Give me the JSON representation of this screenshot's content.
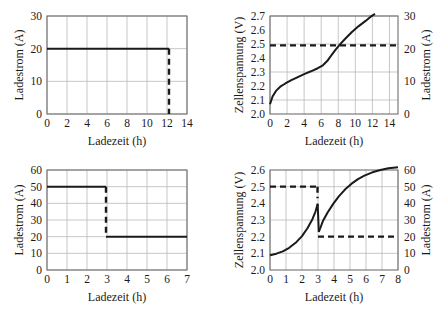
{
  "figure": {
    "background": "#ffffff",
    "line_color": "#1a1a1a",
    "grid_color": "#b9b9b9",
    "frame_color": "#6f6f6f"
  },
  "labels": {
    "ladezeit": "Ladezeit (h)",
    "ladestrom": "Ladestrom (A)",
    "zellenspannung": "Zellenspannung (V)"
  },
  "chart_data": [
    {
      "id": "top-left",
      "type": "line",
      "title": "",
      "xlabel": "Ladezeit (h)",
      "ylabel": "Ladestrom (A)",
      "xlim": [
        0,
        14
      ],
      "ylim": [
        0,
        30
      ],
      "xticks": [
        0,
        2,
        4,
        6,
        8,
        10,
        12,
        14
      ],
      "yticks": [
        0,
        10,
        20,
        30
      ],
      "xtick_labels": [
        "0",
        "2",
        "4",
        "6",
        "8",
        "10",
        "12",
        "14"
      ],
      "ytick_labels": [
        "0",
        "10",
        "20",
        "30"
      ],
      "grid": true,
      "legend": "none",
      "series": [
        {
          "name": "Ladestrom konstant",
          "style": "solid",
          "x": [
            0,
            12.2
          ],
          "values": [
            20,
            20
          ]
        },
        {
          "name": "Stromabschaltung",
          "style": "dashed",
          "x": [
            12.2,
            12.2
          ],
          "values": [
            20,
            0
          ]
        }
      ]
    },
    {
      "id": "top-right",
      "type": "line",
      "title": "",
      "xlabel": "Ladezeit (h)",
      "ylabel": "Zellenspannung (V)",
      "ylabel_right": "Ladestrom (A)",
      "xlim": [
        0,
        15
      ],
      "ylim": [
        2.0,
        2.7
      ],
      "ylim_right": [
        0,
        30
      ],
      "xticks": [
        0,
        2,
        4,
        6,
        8,
        10,
        12,
        14
      ],
      "yticks": [
        2.0,
        2.1,
        2.2,
        2.3,
        2.4,
        2.5,
        2.6,
        2.7
      ],
      "yticks_right": [
        0,
        10,
        20,
        30
      ],
      "xtick_labels": [
        "0",
        "2",
        "4",
        "6",
        "8",
        "10",
        "12",
        "14"
      ],
      "ytick_labels": [
        "2.0",
        "2.1",
        "2.2",
        "2.3",
        "2.4",
        "2.5",
        "2.6",
        "2.7"
      ],
      "ytick_labels_right": [
        "0",
        "10",
        "20",
        "30"
      ],
      "grid": true,
      "legend": "none",
      "series": [
        {
          "name": "Zellenspannung",
          "style": "solid",
          "axis": "left",
          "x": [
            0,
            0.3,
            0.7,
            1.2,
            1.8,
            2.5,
            3.2,
            4.0,
            4.8,
            5.6,
            6.2,
            6.7,
            7.1,
            7.6,
            8.2,
            8.9,
            9.6,
            10.4,
            11.2,
            11.8,
            12.3
          ],
          "values": [
            2.07,
            2.125,
            2.165,
            2.195,
            2.218,
            2.242,
            2.262,
            2.285,
            2.305,
            2.327,
            2.348,
            2.378,
            2.412,
            2.452,
            2.497,
            2.543,
            2.586,
            2.628,
            2.665,
            2.695,
            2.715
          ]
        },
        {
          "name": "Ladestrom konstant 21 A",
          "style": "dashed",
          "axis": "right",
          "x": [
            0,
            15
          ],
          "values": [
            21,
            21
          ]
        }
      ]
    },
    {
      "id": "bottom-left",
      "type": "line",
      "title": "",
      "xlabel": "Ladezeit (h)",
      "ylabel": "Ladestrom (A)",
      "xlim": [
        0,
        7
      ],
      "ylim": [
        0,
        60
      ],
      "xticks": [
        0,
        1,
        2,
        3,
        4,
        5,
        6,
        7
      ],
      "yticks": [
        0,
        10,
        20,
        30,
        40,
        50,
        60
      ],
      "xtick_labels": [
        "0",
        "1",
        "2",
        "3",
        "4",
        "5",
        "6",
        "7"
      ],
      "ytick_labels": [
        "0",
        "10",
        "20",
        "30",
        "40",
        "50",
        "60"
      ],
      "grid": true,
      "legend": "none",
      "series": [
        {
          "name": "Ladestrom Stufe 1",
          "style": "solid",
          "x": [
            0,
            2.95
          ],
          "values": [
            50,
            50
          ]
        },
        {
          "name": "Stromumschaltung",
          "style": "dashed",
          "x": [
            2.95,
            2.95
          ],
          "values": [
            50,
            20
          ]
        },
        {
          "name": "Ladestrom Stufe 2",
          "style": "solid",
          "x": [
            2.95,
            7
          ],
          "values": [
            20,
            20
          ]
        }
      ]
    },
    {
      "id": "bottom-right",
      "type": "line",
      "title": "",
      "xlabel": "Ladezeit (h)",
      "ylabel": "Zellenspannung (V)",
      "ylabel_right": "Ladestrom (A)",
      "xlim": [
        0,
        8
      ],
      "ylim": [
        2.0,
        2.6
      ],
      "ylim_right": [
        0,
        60
      ],
      "xticks": [
        0,
        1,
        2,
        3,
        4,
        5,
        6,
        7,
        8
      ],
      "yticks": [
        2.0,
        2.1,
        2.2,
        2.3,
        2.4,
        2.5,
        2.6
      ],
      "yticks_right": [
        0,
        10,
        20,
        30,
        40,
        50,
        60
      ],
      "xtick_labels": [
        "0",
        "1",
        "2",
        "3",
        "4",
        "5",
        "6",
        "7",
        "8"
      ],
      "ytick_labels": [
        "2.0",
        "2.1",
        "2.2",
        "2.3",
        "2.4",
        "2.5",
        "2.6"
      ],
      "ytick_labels_right": [
        "0",
        "10",
        "20",
        "30",
        "40",
        "50",
        "60"
      ],
      "grid": true,
      "legend": "none",
      "series": [
        {
          "name": "Zellenspannung Stufe 1",
          "style": "solid",
          "axis": "left",
          "x": [
            0,
            0.4,
            0.8,
            1.2,
            1.6,
            2.0,
            2.35,
            2.65,
            2.85,
            2.98
          ],
          "values": [
            2.088,
            2.098,
            2.112,
            2.133,
            2.163,
            2.203,
            2.252,
            2.305,
            2.352,
            2.398
          ]
        },
        {
          "name": "Spannungseinbruch",
          "style": "solid",
          "axis": "left",
          "x": [
            2.98,
            3.05
          ],
          "values": [
            2.398,
            2.228
          ]
        },
        {
          "name": "Zellenspannung Stufe 2",
          "style": "solid",
          "axis": "left",
          "x": [
            3.05,
            3.3,
            3.6,
            3.95,
            4.3,
            4.7,
            5.1,
            5.5,
            5.9,
            6.4,
            6.9,
            7.4,
            8.0
          ],
          "values": [
            2.228,
            2.292,
            2.345,
            2.397,
            2.442,
            2.484,
            2.518,
            2.545,
            2.566,
            2.586,
            2.6,
            2.61,
            2.617
          ]
        },
        {
          "name": "Ladestrom Stufe 1",
          "style": "dashed",
          "axis": "right",
          "x": [
            0,
            2.97
          ],
          "values": [
            50,
            50
          ]
        },
        {
          "name": "Stromumschaltung",
          "style": "dashed",
          "axis": "right",
          "x": [
            2.97,
            2.97
          ],
          "values": [
            50,
            43
          ]
        },
        {
          "name": "Ladestrom Stufe 2",
          "style": "dashed",
          "axis": "right",
          "x": [
            3.0,
            8
          ],
          "values": [
            20,
            20
          ]
        }
      ]
    }
  ]
}
